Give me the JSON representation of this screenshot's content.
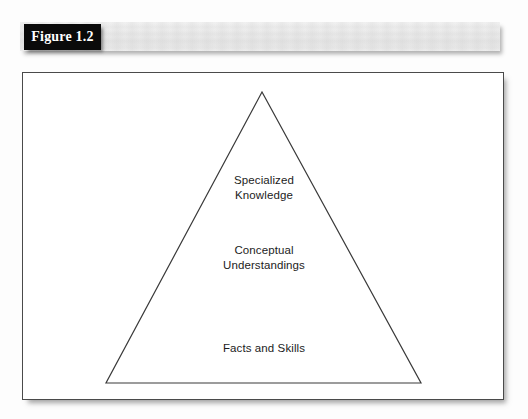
{
  "figure": {
    "caption_label": "Figure 1.2"
  },
  "diagram": {
    "type": "pyramid",
    "orientation": "apex-up",
    "tiers": [
      {
        "id": "top",
        "label": "Specialized\nKnowledge"
      },
      {
        "id": "middle",
        "label": "Conceptual\nUnderstandings"
      },
      {
        "id": "bottom",
        "label": "Facts and Skills"
      }
    ],
    "stroke_color": "#3a3a3a",
    "fill_color": "#ffffff",
    "frame_border_color": "#4a4a4a",
    "banner_color": "#eaeaea",
    "label_box_color": "#0a0a0a",
    "label_text_color": "#ffffff"
  }
}
